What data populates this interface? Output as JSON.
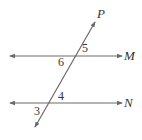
{
  "diagram": {
    "type": "parallel-lines-transversal",
    "colors": {
      "line": "#6a6a6a",
      "text": "#333333"
    },
    "lines": [
      {
        "id": "M",
        "label": "M",
        "x1": 10,
        "y1": 56,
        "x2": 122,
        "y2": 56
      },
      {
        "id": "N",
        "label": "N",
        "x1": 10,
        "y1": 103,
        "x2": 122,
        "y2": 103
      },
      {
        "id": "P",
        "label": "P",
        "x1": 35,
        "y1": 127,
        "x2": 95,
        "y2": 22
      }
    ],
    "angles": [
      {
        "label": "5",
        "x": 82,
        "y": 52
      },
      {
        "label": "6",
        "x": 58,
        "y": 66
      },
      {
        "label": "4",
        "x": 58,
        "y": 100
      },
      {
        "label": "3",
        "x": 34,
        "y": 115
      }
    ],
    "line_labels": {
      "P": {
        "text": "P",
        "x": 97,
        "y": 18
      },
      "M": {
        "text": "M",
        "x": 124,
        "y": 60
      },
      "N": {
        "text": "N",
        "x": 124,
        "y": 107
      }
    }
  }
}
